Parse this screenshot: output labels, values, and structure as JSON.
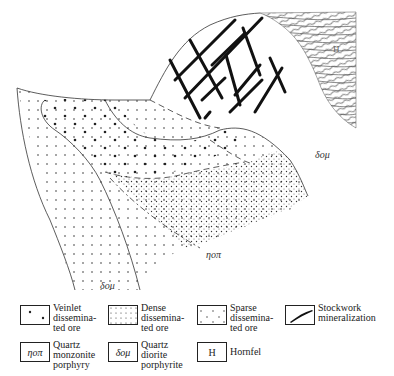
{
  "map": {
    "labels": {
      "dom_right": "δομ",
      "dom_bottom": "δομ",
      "ngp": "ηοπ",
      "hornfel": "H"
    }
  },
  "legend": {
    "items": [
      {
        "id": "veinlet",
        "symbol": "",
        "text": "Veinlet\ndissemina-\nted ore"
      },
      {
        "id": "dense",
        "symbol": "",
        "text": "Dense\ndissemina-\nted ore"
      },
      {
        "id": "sparse",
        "symbol": "",
        "text": "Sparse\ndissemina-\nted ore"
      },
      {
        "id": "stockwork",
        "symbol": "",
        "text": "Stockwork\nmineralization"
      },
      {
        "id": "qmp",
        "symbol": "ηοπ",
        "text": "Quartz\nmonzonite\nporphyry"
      },
      {
        "id": "qdp",
        "symbol": "δομ",
        "text": "Quartz\ndiorite\nporphyrite"
      },
      {
        "id": "hornfel",
        "symbol": "H",
        "text": "Hornfel"
      }
    ]
  },
  "colors": {
    "line": "#222222",
    "hatch": "#555555"
  }
}
